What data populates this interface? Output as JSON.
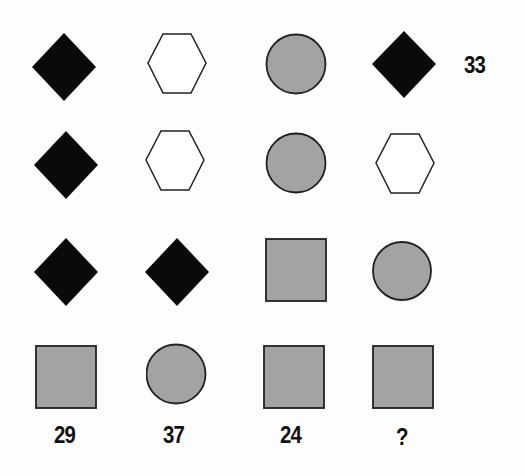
{
  "puzzle": {
    "colors": {
      "black": "#0a0a0a",
      "gray": "#a3a3a3",
      "outline": "#222222",
      "white": "#ffffff"
    },
    "grid": [
      [
        "diamond-black",
        "hexagon-white",
        "circle-gray",
        "diamond-black"
      ],
      [
        "diamond-black",
        "hexagon-white",
        "circle-gray",
        "hexagon-white"
      ],
      [
        "diamond-black",
        "diamond-black",
        "square-gray",
        "circle-gray"
      ],
      [
        "square-gray",
        "circle-gray",
        "square-gray",
        "square-gray"
      ]
    ],
    "row_totals": [
      "33",
      "",
      "",
      ""
    ],
    "column_totals": [
      "29",
      "37",
      "24",
      "?"
    ]
  }
}
